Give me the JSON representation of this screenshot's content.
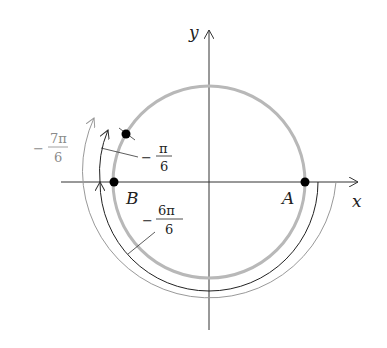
{
  "diagram": {
    "axes": {
      "x_label": "x",
      "y_label": "y"
    },
    "points": [
      {
        "name": "A",
        "label": "A"
      },
      {
        "name": "B",
        "label": "B"
      },
      {
        "name": "P",
        "label": ""
      }
    ],
    "angles": [
      {
        "id": "neg_pi_6",
        "sign": "−",
        "numerator": "π",
        "denominator": "6"
      },
      {
        "id": "neg_6pi_6",
        "sign": "−",
        "numerator": "6π",
        "denominator": "6"
      },
      {
        "id": "neg_7pi_6",
        "sign": "−",
        "numerator": "7π",
        "denominator": "6"
      }
    ],
    "colors": {
      "circle": "#b8b8b8",
      "inner_arc": "#222222",
      "outer_arc": "#9a9a9a",
      "axis": "#333333"
    }
  }
}
